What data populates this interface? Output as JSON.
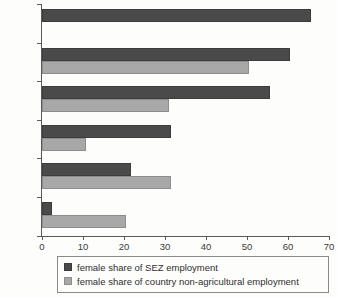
{
  "chart_data": {
    "type": "bar",
    "orientation": "horizontal",
    "title": "",
    "subtitle": "",
    "xlabel": "",
    "ylabel": "",
    "xlim": [
      0,
      70
    ],
    "xticks": [
      0,
      10,
      20,
      30,
      40,
      50,
      60,
      70
    ],
    "xtick_labels": [
      "0",
      "10",
      "20",
      "30",
      "40",
      "50",
      "60",
      "70"
    ],
    "grid": false,
    "legend_position": "bottom",
    "categories": [
      "Kenya",
      "Lesotho",
      "Tanzania",
      "Senegal",
      "Ghana",
      "Nigeria"
    ],
    "series": [
      {
        "name": "female share of SEZ employment",
        "color": "#4a4a4a",
        "values": [
          65.5,
          60.5,
          55.5,
          31.5,
          21.8,
          2.5
        ]
      },
      {
        "name": "female share of country non-agricultural employment",
        "color": "#a8a8a8",
        "values": [
          null,
          50.5,
          31.0,
          10.8,
          31.5,
          20.5
        ]
      }
    ]
  },
  "legend": {
    "items": [
      {
        "label": "female share of SEZ employment",
        "swatch": "dark"
      },
      {
        "label": "female share of country non-agricultural employment",
        "swatch": "light"
      }
    ]
  },
  "colors": {
    "series_dark": "#4a4a4a",
    "series_light": "#a8a8a8",
    "axis": "#5a5a5a",
    "text": "#3a3a3a",
    "background": "#fdfdfb"
  }
}
